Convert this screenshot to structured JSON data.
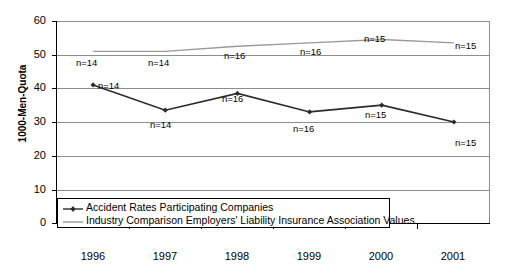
{
  "chart": {
    "type": "line",
    "ylabel": "1000-Men-Quota",
    "xlabel": "",
    "title": ""
  },
  "chart_data": {
    "type": "line",
    "title": "",
    "xlabel": "",
    "ylabel": "1000-Men-Quota",
    "categories": [
      "1996",
      "1997",
      "1998",
      "1999",
      "2000",
      "2001"
    ],
    "ylim": [
      0,
      60
    ],
    "yticks": [
      0,
      10,
      20,
      30,
      40,
      50,
      60
    ],
    "grid": true,
    "legend_position": "bottom-left-inside",
    "series": [
      {
        "name": "Accident Rates Participating Companies",
        "color": "#2b2b2b",
        "marker": "diamond",
        "values": [
          41,
          33.5,
          38.5,
          33,
          35,
          30
        ],
        "point_labels": [
          "n=14",
          "n=14",
          "n=16",
          "n=16",
          "n=15",
          "n=15"
        ]
      },
      {
        "name": "Industry Comparison Employers' Liability Insurance Association Values",
        "color": "#9a9a9a",
        "marker": "none",
        "values": [
          51,
          51,
          52.5,
          53.5,
          54.5,
          53.5
        ],
        "point_labels": [
          "n=14",
          "n=14",
          "n=16",
          "n=16",
          "n=15",
          "n=15"
        ]
      }
    ]
  },
  "ytick_labels": [
    "60",
    "50",
    "40",
    "30",
    "20",
    "10",
    "0"
  ],
  "xtick_labels": [
    "1996",
    "1997",
    "1998",
    "1999",
    "2000",
    "2001"
  ],
  "legend": {
    "items": [
      {
        "label": "Accident Rates Participating Companies"
      },
      {
        "label": "Industry Comparison Employers' Liability Insurance Association Values"
      }
    ]
  },
  "annotations": {
    "dark": [
      "n=14",
      "n=14",
      "n=16",
      "n=16",
      "n=15",
      "n=15"
    ],
    "gray": [
      "n=14",
      "n=14",
      "n=16",
      "n=16",
      "n=15",
      "n=15"
    ]
  }
}
